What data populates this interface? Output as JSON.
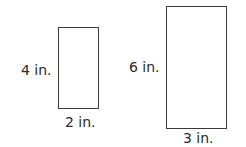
{
  "figures": [
    {
      "name": "small-rectangle",
      "height_label": "4 in.",
      "width_label": "2 in.",
      "height": 4,
      "width": 2,
      "unit": "in."
    },
    {
      "name": "large-rectangle",
      "height_label": "6 in.",
      "width_label": "3 in.",
      "height": 6,
      "width": 3,
      "unit": "in."
    }
  ],
  "colors": {
    "stroke": "#3a3a3a",
    "text": "#2b2b2b",
    "background": "#ffffff"
  }
}
